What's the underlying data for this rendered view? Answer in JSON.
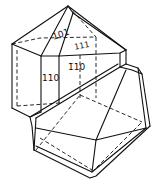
{
  "figure": {
    "type": "crystal-drawing",
    "face_labels": [
      {
        "id": "face-101",
        "text": "101",
        "x": 60,
        "y": 36,
        "rotate": -20
      },
      {
        "id": "face-111",
        "text": "111",
        "x": 72,
        "y": 48,
        "rotate": 0
      },
      {
        "id": "face-110-left",
        "text": "110",
        "x": 43,
        "y": 81,
        "rotate": 0
      },
      {
        "id": "face-110-right",
        "text": "1̄ 1 0",
        "x": 72,
        "y": 70,
        "rotate": 0
      }
    ],
    "line_color": "#111111",
    "background": "#ffffff"
  }
}
